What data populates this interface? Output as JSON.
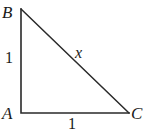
{
  "figure": {
    "kind": "right-triangle-diagram",
    "background_color": "#ffffff",
    "stroke_color": "#1a1a1a",
    "text_color": "#1a1a1a"
  },
  "vertices": {
    "top_left": {
      "label": "B",
      "x": 21,
      "y": 9
    },
    "bottom_left": {
      "label": "A",
      "x": 21,
      "y": 113
    },
    "bottom_right": {
      "label": "C",
      "x": 129,
      "y": 113
    }
  },
  "sides": {
    "vertical_leg": {
      "name": "AB",
      "label": "1"
    },
    "horizontal_leg": {
      "name": "AC",
      "label": "1"
    },
    "hypotenuse": {
      "name": "BC",
      "label": "x"
    }
  }
}
